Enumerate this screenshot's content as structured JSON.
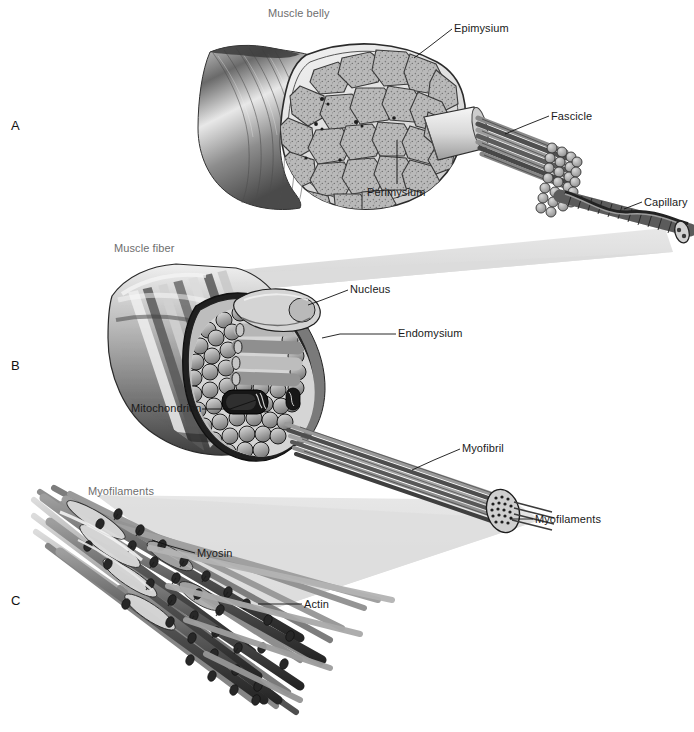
{
  "figure": {
    "background_color": "#ffffff",
    "ink_color": "#1a1a1a",
    "gray_label_color": "#6e6e6e",
    "magnification_wedge_color": "#dcdcdc"
  },
  "panels": [
    {
      "id": "A",
      "letter": "A",
      "x": 11,
      "y": 119,
      "subject": "muscle-belly-cross-section"
    },
    {
      "id": "B",
      "letter": "B",
      "x": 11,
      "y": 359,
      "subject": "muscle-fiber-cross-section"
    },
    {
      "id": "C",
      "letter": "C",
      "x": 11,
      "y": 594,
      "subject": "myofilaments-detail"
    }
  ],
  "labels": [
    {
      "name": "muscle-belly",
      "text": "Muscle belly",
      "x": 268,
      "y": 8,
      "style": "gray",
      "panel": "A",
      "leader": false
    },
    {
      "name": "epimysium",
      "text": "Epimysium",
      "x": 454,
      "y": 23,
      "style": "black",
      "panel": "A",
      "leader": true
    },
    {
      "name": "fascicle",
      "text": "Fascicle",
      "x": 551,
      "y": 111,
      "style": "black",
      "panel": "A",
      "leader": true
    },
    {
      "name": "capillary",
      "text": "Capillary",
      "x": 644,
      "y": 197,
      "style": "black",
      "panel": "A",
      "leader": true
    },
    {
      "name": "perimysium",
      "text": "Perimysium",
      "x": 367,
      "y": 187,
      "style": "black",
      "panel": "A",
      "leader": true
    },
    {
      "name": "muscle-fiber",
      "text": "Muscle fiber",
      "x": 114,
      "y": 243,
      "style": "gray",
      "panel": "B",
      "leader": false
    },
    {
      "name": "nucleus",
      "text": "Nucleus",
      "x": 350,
      "y": 284,
      "style": "black",
      "panel": "B",
      "leader": true
    },
    {
      "name": "endomysium",
      "text": "Endomysium",
      "x": 398,
      "y": 328,
      "style": "black",
      "panel": "B",
      "leader": true
    },
    {
      "name": "mitochondrion",
      "text": "Mitochondrion",
      "x": 131,
      "y": 403,
      "style": "black",
      "panel": "B",
      "leader": true
    },
    {
      "name": "myofibril",
      "text": "Myofibril",
      "x": 462,
      "y": 443,
      "style": "black",
      "panel": "B",
      "leader": true
    },
    {
      "name": "myofilaments-left",
      "text": "Myofilaments",
      "x": 88,
      "y": 486,
      "style": "gray",
      "panel": "C",
      "leader": false
    },
    {
      "name": "myofilaments-right",
      "text": "Myofilaments",
      "x": 535,
      "y": 514,
      "style": "black",
      "panel": "C",
      "leader": true
    },
    {
      "name": "myosin",
      "text": "Myosin",
      "x": 197,
      "y": 548,
      "style": "black",
      "panel": "C",
      "leader": true
    },
    {
      "name": "actin",
      "text": "Actin",
      "x": 304,
      "y": 599,
      "style": "black",
      "panel": "C",
      "leader": true
    }
  ],
  "structures": {
    "panel_a": {
      "name": "Muscle belly with cut cross-section",
      "parts": [
        "epimysium sheath",
        "fascicle bundles",
        "perimysium sheath",
        "capillary",
        "fascicle strand"
      ]
    },
    "panel_b": {
      "name": "Single muscle fiber, cut open",
      "parts": [
        "striated sarcolemma",
        "nucleus",
        "endomysium",
        "mitochondrion",
        "myofibril bundle"
      ]
    },
    "panel_c": {
      "name": "Myofilament lattice",
      "parts": [
        "thick myosin filaments",
        "thin actin filaments",
        "myosin cross-bridge heads"
      ]
    }
  }
}
